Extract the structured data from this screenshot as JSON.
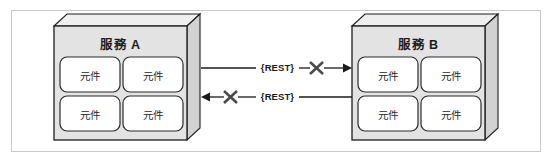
{
  "diagram": {
    "title_alt": "Two services communicating over REST with blocked connections",
    "frame": {
      "border_color": "#c9c9c9",
      "background": "#ffffff"
    },
    "palette": {
      "service_fill": "#e3e3e3",
      "service_top_fill": "#efefef",
      "service_side_fill": "#d2d2d2",
      "component_fill": "#ffffff",
      "stroke": "#1d1d1d",
      "x_mark": "#4a4a4a",
      "line": "#1a1a1a"
    },
    "services": [
      {
        "id": "service-a",
        "title": "服務 A",
        "components": [
          {
            "label": "元件"
          },
          {
            "label": "元件"
          },
          {
            "label": "元件"
          },
          {
            "label": "元件"
          }
        ]
      },
      {
        "id": "service-b",
        "title": "服務 B",
        "components": [
          {
            "label": "元件"
          },
          {
            "label": "元件"
          },
          {
            "label": "元件"
          },
          {
            "label": "元件"
          }
        ]
      }
    ],
    "connections": [
      {
        "id": "connection-a-to-b",
        "label": "{REST}",
        "direction": "right",
        "from": "service-a",
        "to": "service-b",
        "blocked": true,
        "blocked_marker": "x-mark"
      },
      {
        "id": "connection-b-to-a",
        "label": "{REST}",
        "direction": "left",
        "from": "service-b",
        "to": "service-a",
        "blocked": true,
        "blocked_marker": "x-mark"
      }
    ]
  }
}
